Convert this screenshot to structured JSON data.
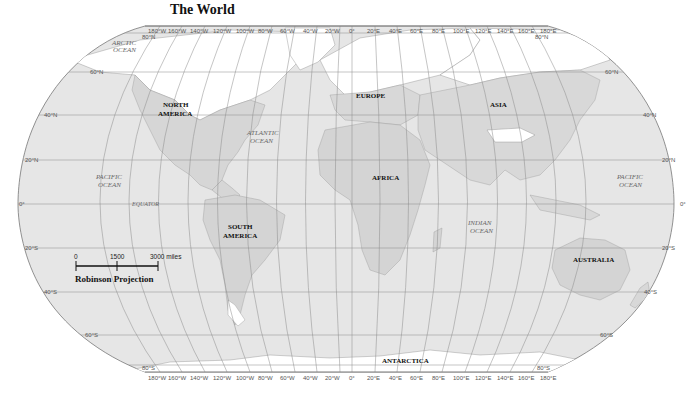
{
  "title": "The World",
  "projection": "Robinson Projection",
  "colors": {
    "ocean": "#e6e6e6",
    "land": "#d9d9d9",
    "ice": "#ffffff",
    "grid": "#8a8a8a",
    "border": "#777777",
    "text": "#111111"
  },
  "longitude_labels_top": [
    "180°W",
    "160°W",
    "140°W",
    "120°W",
    "100°W",
    "80°W",
    "60°W",
    "40°W",
    "20°W",
    "0°",
    "20°E",
    "40°E",
    "60°E",
    "80°E",
    "100°E",
    "120°E",
    "140°E",
    "160°E",
    "180°E"
  ],
  "longitude_labels_bottom": [
    "180°W",
    "160°W",
    "140°W",
    "120°W",
    "100°W",
    "80°W",
    "60°W",
    "40°W",
    "20°W",
    "0°",
    "20°E",
    "40°E",
    "60°E",
    "80°E",
    "100°E",
    "120°E",
    "140°E",
    "160°E",
    "180°E"
  ],
  "latitude_labels_left": [
    "80°N",
    "60°N",
    "40°N",
    "20°N",
    "0°",
    "20°S",
    "40°S",
    "60°S",
    "80°S"
  ],
  "latitude_labels_right": [
    "80°N",
    "60°N",
    "40°N",
    "20°N",
    "0°",
    "20°S",
    "40°S",
    "60°S",
    "80°S"
  ],
  "continents": {
    "north_america": [
      "NORTH",
      "AMERICA"
    ],
    "south_america": [
      "SOUTH",
      "AMERICA"
    ],
    "europe": "EUROPE",
    "asia": "ASIA",
    "africa": "AFRICA",
    "australia": "AUSTRALIA",
    "antarctica": "ANTARCTICA"
  },
  "oceans": {
    "arctic": [
      "ARCTIC",
      "OCEAN"
    ],
    "atlantic": [
      "ATLANTIC",
      "OCEAN"
    ],
    "pacific_west": [
      "PACIFIC",
      "OCEAN"
    ],
    "pacific_east": [
      "PACIFIC",
      "OCEAN"
    ],
    "indian": [
      "INDIAN",
      "OCEAN"
    ]
  },
  "equator_label": "EQUATOR",
  "scale_bar": {
    "ticks": [
      "0",
      "1500",
      "3000 miles"
    ]
  }
}
